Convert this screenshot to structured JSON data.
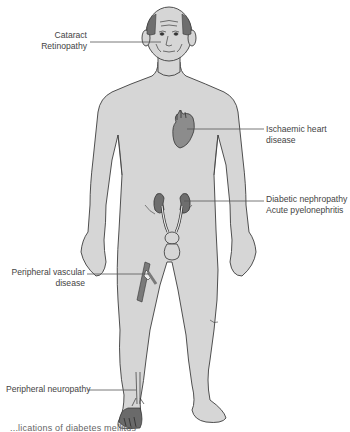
{
  "figure": {
    "type": "anatomical-diagram",
    "colors": {
      "skin_fill": "#d6d6d6",
      "outline": "#3d3d3d",
      "organ_fill": "#7a7a7a",
      "leader_line": "#555555",
      "background": "#ffffff"
    }
  },
  "labels": {
    "eye": {
      "lines": [
        "Cataract",
        "Retinopathy"
      ]
    },
    "heart": {
      "lines": [
        "Ischaemic heart",
        "disease"
      ]
    },
    "kidney": {
      "lines": [
        "Diabetic nephropathy",
        "Acute pyelonephritis"
      ]
    },
    "vascular": {
      "lines": [
        "Peripheral vascular",
        "disease"
      ]
    },
    "neuropathy": {
      "lines": [
        "Peripheral neuropathy"
      ]
    }
  },
  "caption": {
    "text": "...lications of diabetes mellitus"
  }
}
